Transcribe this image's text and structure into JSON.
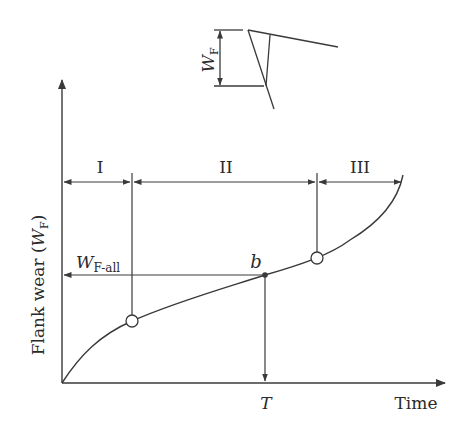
{
  "figure": {
    "type": "tool-wear-curve",
    "colors": {
      "line": "#3a3a3a",
      "text": "#2a2a2a",
      "background": "#ffffff"
    }
  },
  "axes": {
    "y_label_main": "Flank wear (",
    "y_label_var": "W",
    "y_label_sub": "F",
    "y_label_close": ")",
    "x_label": "Time",
    "x_marker": "T"
  },
  "regions": [
    {
      "label": "I"
    },
    {
      "label": "II"
    },
    {
      "label": "III"
    }
  ],
  "annotations": {
    "allowable_wear_var": "W",
    "allowable_wear_sub": "F-all",
    "point_label": "b"
  },
  "inset": {
    "dimension_var": "W",
    "dimension_sub": "F"
  }
}
